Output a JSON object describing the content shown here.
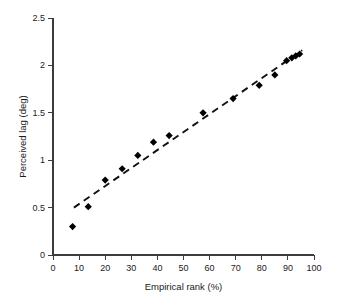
{
  "chart_data": {
    "type": "scatter",
    "title": "",
    "xlabel": "Empirical rank (%)",
    "ylabel": "Perceived lag (deg)",
    "xlim": [
      0,
      100
    ],
    "ylim": [
      0,
      2.5
    ],
    "xticks": [
      0,
      10,
      20,
      30,
      40,
      50,
      60,
      70,
      80,
      90,
      100
    ],
    "xtick_labels": [
      "0",
      "10",
      "20",
      "30",
      "40",
      "50",
      "60",
      "70",
      "80",
      "90",
      "100"
    ],
    "yticks": [
      0,
      0.5,
      1,
      1.5,
      2,
      2.5
    ],
    "ytick_labels": [
      "0",
      "0.5",
      "1",
      "1.5",
      "2",
      "2.5"
    ],
    "grid": false,
    "legend": false,
    "marker": "filled-diamond",
    "marker_color": "#000000",
    "series": [
      {
        "name": "Perceived lag",
        "x": [
          7.5,
          13.5,
          20.0,
          26.5,
          32.5,
          38.5,
          44.5,
          57.5,
          69.0,
          79.0,
          85.0,
          89.5,
          91.5,
          93.0,
          94.5
        ],
        "y": [
          0.3,
          0.51,
          0.79,
          0.91,
          1.05,
          1.19,
          1.26,
          1.5,
          1.65,
          1.79,
          1.9,
          2.05,
          2.08,
          2.1,
          2.12
        ]
      }
    ],
    "fit_line": {
      "name": "linear fit",
      "style": "dashed",
      "color": "#111111",
      "x_start": 8.0,
      "y_start": 0.5,
      "x_end": 95.5,
      "y_end": 2.16
    }
  },
  "axes": {
    "x_title": "Empirical rank (%)",
    "y_title": "Perceived lag (deg)"
  }
}
